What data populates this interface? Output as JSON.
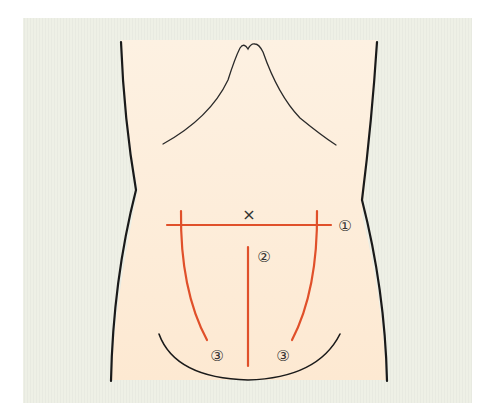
{
  "diagram": {
    "colors": {
      "page_background": "#ffffff",
      "panel_background": "#eef0e6",
      "torso_fill_top": "#fdf0de",
      "torso_fill_bottom": "#fde8cf",
      "outline": "#1a1a1a",
      "incision": "#e0502a"
    },
    "marker": {
      "symbol": "×",
      "meaning": "umbilicus"
    },
    "incisions": [
      {
        "id": "1",
        "label": "①",
        "type": "transverse"
      },
      {
        "id": "2",
        "label": "②",
        "type": "lower midline"
      },
      {
        "id": "3a",
        "label": "③",
        "type": "left paramedian"
      },
      {
        "id": "3b",
        "label": "③",
        "type": "right paramedian"
      }
    ]
  }
}
